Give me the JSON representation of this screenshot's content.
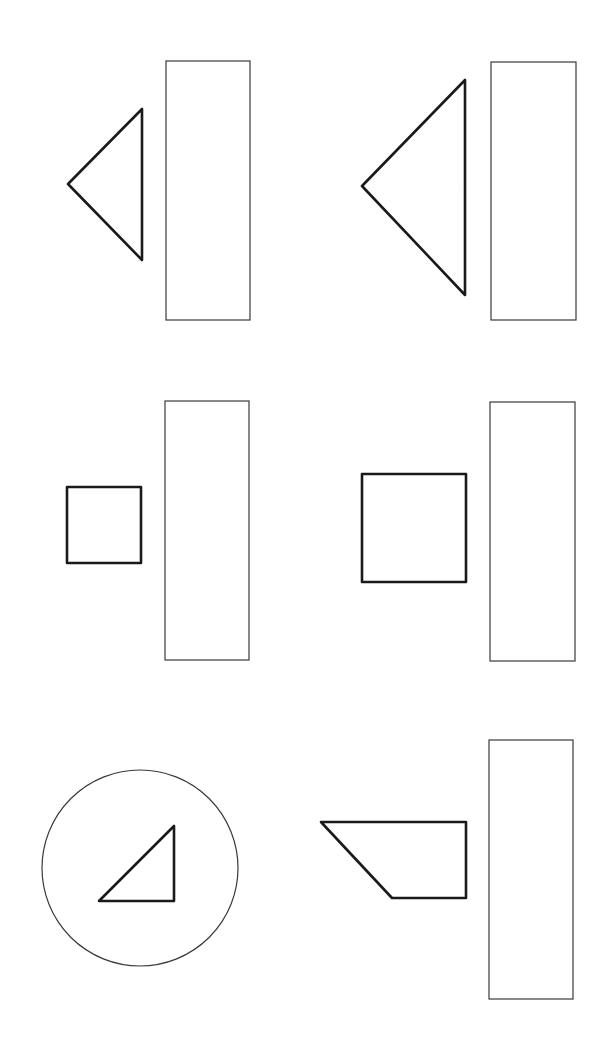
{
  "colors": {
    "background": "#ffffff",
    "outline_thin": "#3a3a3a",
    "outline_thick": "#1a1a1a"
  },
  "panels": [
    {
      "id": "panel-1",
      "shape": "isosceles-triangle-pointing-left",
      "shape_points": "68,184 142,109 142,260",
      "bar": {
        "x": 166,
        "y": 61,
        "w": 84,
        "h": 259
      }
    },
    {
      "id": "panel-2",
      "shape": "large-isosceles-triangle-pointing-left",
      "shape_points": "362,186 465,80 465,295",
      "bar": {
        "x": 491,
        "y": 62,
        "w": 85,
        "h": 258
      }
    },
    {
      "id": "panel-3",
      "shape": "small-square",
      "shape_points": "67,487 141,487 141,563 67,563",
      "bar": {
        "x": 165,
        "y": 401,
        "w": 84,
        "h": 259
      }
    },
    {
      "id": "panel-4",
      "shape": "large-square",
      "shape_points": "362,474 466,474 466,582 362,582",
      "bar": {
        "x": 490,
        "y": 402,
        "w": 85,
        "h": 259
      }
    },
    {
      "id": "panel-5",
      "shape": "right-triangle-in-circle",
      "shape_points": "99,901 174,826 174,901",
      "circle": {
        "cx": 140,
        "cy": 868,
        "r": 98
      }
    },
    {
      "id": "panel-6",
      "shape": "trapezoid",
      "shape_points": "321,822 466,822 466,898 392,898",
      "bar": {
        "x": 489,
        "y": 740,
        "w": 84,
        "h": 259
      }
    }
  ]
}
